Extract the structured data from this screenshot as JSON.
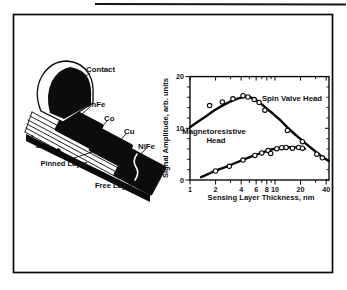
{
  "figure": {
    "diagram": {
      "contact_label": "Contact",
      "mnfe_label": "MnFe",
      "co_label": "Co",
      "cu_label": "Cu",
      "nife_label": "NiFe",
      "current_label": "I",
      "pinned_layer_label": "Pinned Layer",
      "free_layer_label": "Free Layer"
    },
    "chart": {
      "ylabel": "Signal Amplitude, arb. units",
      "xlabel": "Sensing Layer Thickness, nm",
      "spin_valve_label": "Spin Valve Head",
      "mr_label_line1": "Magnetoresistive",
      "mr_label_line2": "Head"
    },
    "ink_color": "#0a0a0a",
    "paper_color": "#ffffff"
  },
  "chart_data": {
    "type": "line",
    "title": "",
    "xlabel": "Sensing Layer Thickness, nm",
    "ylabel": "Signal Amplitude, arb. units",
    "x_scale": "log",
    "xlim": [
      1,
      43
    ],
    "ylim": [
      0,
      20
    ],
    "x_ticks_labeled": [
      1,
      2,
      4,
      6,
      8,
      10,
      20,
      40
    ],
    "x_ticks_minor": [
      3,
      5,
      7,
      9,
      30
    ],
    "y_ticks_labeled": [
      0,
      10,
      20
    ],
    "y_tick_minor_step": 2,
    "grid": false,
    "legend_position": "inline-annotations",
    "series": [
      {
        "name": "Spin Valve Head",
        "line": [
          [
            1,
            10.2
          ],
          [
            1.2,
            11.1
          ],
          [
            1.5,
            12.2
          ],
          [
            1.9,
            13.4
          ],
          [
            2.4,
            14.4
          ],
          [
            3,
            15.2
          ],
          [
            3.7,
            15.8
          ],
          [
            4.4,
            16.1
          ],
          [
            5,
            16.1
          ],
          [
            5.8,
            15.6
          ],
          [
            6.8,
            14.8
          ],
          [
            8,
            13.8
          ],
          [
            9.5,
            12.8
          ],
          [
            11.5,
            11.6
          ],
          [
            14,
            10.2
          ],
          [
            17,
            8.9
          ],
          [
            20,
            7.9
          ],
          [
            24,
            6.8
          ],
          [
            29,
            5.7
          ],
          [
            35,
            4.6
          ],
          [
            43,
            3.7
          ]
        ],
        "points": [
          [
            1.7,
            14.4
          ],
          [
            2.4,
            15.1
          ],
          [
            3.2,
            15.7
          ],
          [
            4.2,
            16.3
          ],
          [
            4.8,
            16.05
          ],
          [
            5.7,
            15.55
          ],
          [
            6.5,
            15.0
          ],
          [
            7.6,
            13.5
          ],
          [
            14,
            9.6
          ],
          [
            21,
            7.4
          ],
          [
            31,
            5.0
          ],
          [
            36,
            4.3
          ]
        ]
      },
      {
        "name": "Magnetoresistive Head",
        "line": [
          [
            1.35,
            0.55
          ],
          [
            1.6,
            1.1
          ],
          [
            2,
            1.8
          ],
          [
            2.6,
            2.5
          ],
          [
            3.3,
            3.2
          ],
          [
            4.2,
            3.9
          ],
          [
            5.2,
            4.5
          ],
          [
            6.3,
            5.0
          ],
          [
            7.6,
            5.5
          ],
          [
            9,
            5.9
          ],
          [
            10.5,
            6.1
          ],
          [
            12.5,
            6.3
          ],
          [
            15,
            6.35
          ],
          [
            18,
            6.3
          ],
          [
            20.5,
            6.2
          ],
          [
            22.5,
            6.05
          ]
        ],
        "points": [
          [
            2,
            1.75
          ],
          [
            2.9,
            2.65
          ],
          [
            4.2,
            3.85
          ],
          [
            5.8,
            4.75
          ],
          [
            7,
            5.25
          ],
          [
            8.3,
            5.7
          ],
          [
            8.9,
            5.15
          ],
          [
            10.5,
            6.05
          ],
          [
            12,
            6.25
          ],
          [
            13.5,
            6.3
          ],
          [
            16,
            6.15
          ],
          [
            19,
            6.3
          ],
          [
            21,
            6.15
          ]
        ]
      }
    ]
  }
}
